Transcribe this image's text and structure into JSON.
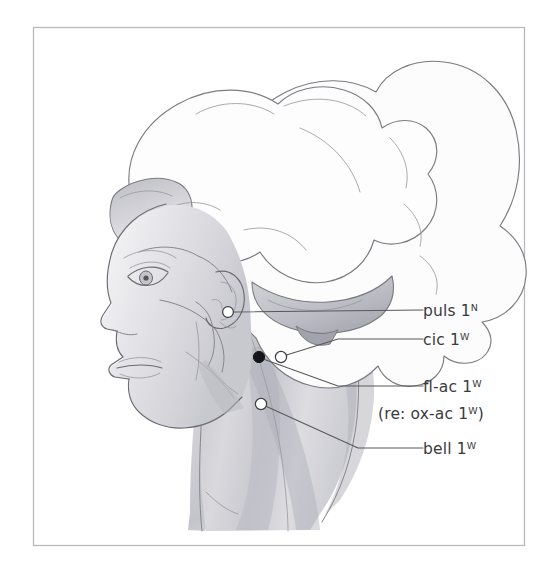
{
  "figure": {
    "kind": "anatomical-line-illustration",
    "frame": {
      "visible": true,
      "border_color": "#b9b9bd",
      "background_color": "#ffffff",
      "x": 33,
      "y": 27,
      "width": 492,
      "height": 519
    },
    "palette": {
      "ink": "#6b6b70",
      "ink_soft": "#86868c",
      "ink_fine": "#9b9ba1",
      "label_text": "#3a3a3c",
      "leader_line": "#58585a",
      "marker_open_fill": "#ffffff",
      "marker_filled_fill": "#15151a",
      "skin_shade_light": "#ededf0",
      "skin_shade_mid": "#d9d9dd",
      "skin_shade_dark": "#bcbcc2",
      "hair_fill": "#fcfcfd"
    }
  },
  "labels": [
    {
      "id": "puls",
      "name": "puls",
      "remedy": "puls",
      "grade": "1",
      "superscript": "N",
      "full_text": "puls 1N",
      "marker_style": "open",
      "marker": {
        "x": 228,
        "y": 312,
        "r": 5.4
      },
      "text_anchor": {
        "x": 423,
        "y": 311
      },
      "leader_path": "M 233.5 312 L 423 310"
    },
    {
      "id": "cic",
      "name": "cic",
      "remedy": "cic",
      "grade": "1",
      "superscript": "W",
      "full_text": "cic 1W",
      "marker_style": "open",
      "marker": {
        "x": 281,
        "y": 357,
        "r": 5.6
      },
      "text_anchor": {
        "x": 423,
        "y": 340
      },
      "leader_path": "M 286.5 355 L 338 339 L 423 339"
    },
    {
      "id": "fl-ac",
      "name": "fl-ac",
      "remedy": "fl-ac",
      "grade": "1",
      "superscript": "W",
      "full_text": "fl-ac 1W",
      "marker_style": "filled",
      "marker": {
        "x": 259,
        "y": 357,
        "r": 5.6
      },
      "text_anchor": {
        "x": 423,
        "y": 389
      },
      "leader_path": "M 264.5 359.5 L 338 386 L 423 386"
    },
    {
      "id": "fl-ac-note",
      "name": "fl-ac cross reference",
      "full_text": "(re: ox-ac 1W)",
      "prefix": "(re: ox-ac ",
      "grade": "1",
      "superscript": "W",
      "suffix": ")",
      "marker_style": "none",
      "text_anchor": {
        "x": 378,
        "y": 414
      },
      "is_note": true
    },
    {
      "id": "bell",
      "name": "bell",
      "remedy": "bell",
      "grade": "1",
      "superscript": "W",
      "full_text": "bell 1W",
      "marker_style": "open",
      "marker": {
        "x": 261,
        "y": 404,
        "r": 5.6
      },
      "text_anchor": {
        "x": 423,
        "y": 452
      },
      "leader_path": "M 266.5 406.5 L 358 448 L 423 448"
    }
  ],
  "label_text": {
    "puls": "puls",
    "cic": "cic",
    "fl_ac": "fl-ac",
    "bell": "bell",
    "grade_one": "1",
    "sup_N": "N",
    "sup_W": "W",
    "note_prefix": "(re: ox-ac ",
    "note_suffix": ")"
  }
}
